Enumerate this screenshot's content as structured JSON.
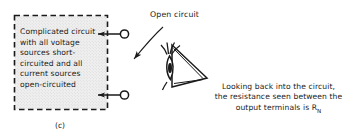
{
  "figure": {
    "part_label": "(c)",
    "box": {
      "text_lines": [
        "Complicated circuit",
        "with all voltage",
        "sources short-",
        "circuited and all",
        "current sources",
        "open-circuited"
      ],
      "text": "Complicated circuit\nwith all voltage\nsources short-\ncircuited and all\ncurrent sources\nopen-circuited",
      "border_style": "dashed",
      "border_color": "#1a1a1a",
      "fill_color": "#ededed"
    },
    "annotation": {
      "open_circuit_label": "Open circuit",
      "arrow": "curved-arrow-pointing-to-upper-terminal"
    },
    "terminals": [
      {
        "name": "upper-terminal",
        "style": "open-circle"
      },
      {
        "name": "lower-terminal",
        "style": "open-circle"
      }
    ],
    "eye": {
      "icon": "eye-looking-left",
      "caption_lines": [
        "Looking back into the circuit,",
        "the resistance seen between the",
        "output terminals is R"
      ],
      "caption_line1": "Looking back into the circuit,",
      "caption_line2": "the resistance seen between the",
      "caption_line3_pre": "output terminals is R",
      "caption_line3_sub": "N"
    }
  },
  "colors": {
    "ink": "#1a1a1a",
    "background": "#ffffff",
    "box_fill": "#ededed"
  }
}
